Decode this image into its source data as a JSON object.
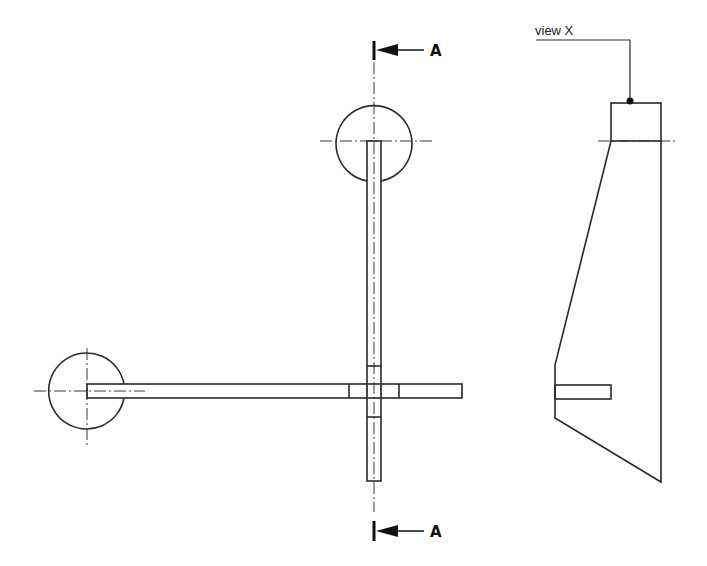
{
  "drawing": {
    "section_marker_top": {
      "letter": "A"
    },
    "section_marker_bottom": {
      "letter": "A"
    },
    "view_label": "view X",
    "colors": {
      "line": "#2a2a2a",
      "background": "#ffffff"
    }
  }
}
